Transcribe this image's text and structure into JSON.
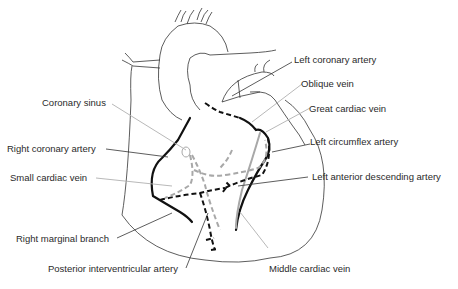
{
  "diagram": {
    "labels": {
      "left_coronary_artery": "Left coronary artery",
      "oblique_vein": "Oblique vein",
      "great_cardiac_vein": "Great cardiac vein",
      "left_circumflex_artery": "Left circumflex artery",
      "left_anterior_descending_artery": "Left anterior descending artery",
      "middle_cardiac_vein": "Middle cardiac vein",
      "coronary_sinus": "Coronary sinus",
      "right_coronary_artery": "Right coronary artery",
      "small_cardiac_vein": "Small cardiac vein",
      "right_marginal_branch": "Right marginal branch",
      "posterior_interventricular_artery": "Posterior interventricular artery"
    },
    "legend_encoding": {
      "arteries": "black lines",
      "veins": "grey lines",
      "posterior_surface": "dashed lines",
      "anterior_surface": "solid lines"
    },
    "colors": {
      "artery": "#111111",
      "vein": "#a8a8a8",
      "outline": "#333333",
      "label_text": "#2a2a2a"
    }
  }
}
